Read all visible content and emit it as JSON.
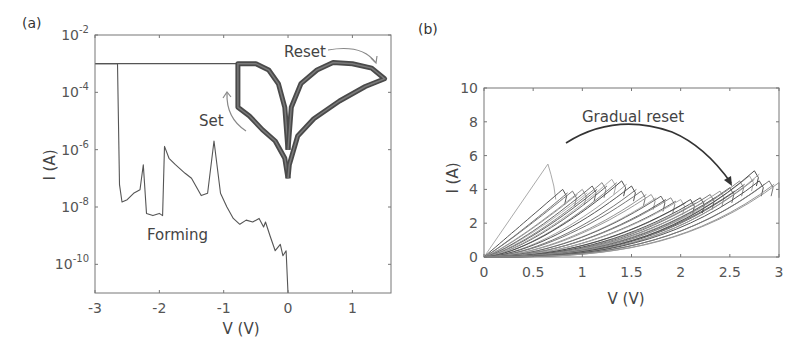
{
  "chart_data": [
    {
      "panel": "(a)",
      "type": "line",
      "xlabel": "V (V)",
      "ylabel": "I (A)",
      "yscale": "log",
      "xlim": [
        -3,
        1.6
      ],
      "ylim": [
        1e-11,
        0.01
      ],
      "xticks": [
        "-3",
        "-2",
        "-1",
        "0",
        "1"
      ],
      "yticks": [
        {
          "base": "10",
          "exp": "-2"
        },
        {
          "base": "10",
          "exp": "-4"
        },
        {
          "base": "10",
          "exp": "-6"
        },
        {
          "base": "10",
          "exp": "-8"
        },
        {
          "base": "10",
          "exp": "-10"
        }
      ],
      "grid": false,
      "annotations": [
        {
          "text": "Reset",
          "x": 0.85,
          "y": 0.0015
        },
        {
          "text": "Set",
          "x": -0.9,
          "y": 1.5e-05
        },
        {
          "text": "Forming",
          "x": -1.6,
          "y": 5e-09
        }
      ],
      "compliance_current": 0.001,
      "series": [
        {
          "name": "Forming",
          "points": [
            [
              0,
              1e-11
            ],
            [
              -0.03,
              3e-10
            ],
            [
              -0.08,
              2e-10
            ],
            [
              -0.12,
              5e-10
            ],
            [
              -0.2,
              3e-10
            ],
            [
              -0.28,
              1e-09
            ],
            [
              -0.35,
              3e-09
            ],
            [
              -0.38,
              2e-09
            ],
            [
              -0.45,
              4e-09
            ],
            [
              -0.55,
              3e-09
            ],
            [
              -0.65,
              3.5e-09
            ],
            [
              -0.75,
              2.5e-09
            ],
            [
              -0.85,
              4e-09
            ],
            [
              -0.95,
              1e-08
            ],
            [
              -1.05,
              3e-08
            ],
            [
              -1.15,
              2e-06
            ],
            [
              -1.25,
              3e-08
            ],
            [
              -1.35,
              2.5e-08
            ],
            [
              -1.5,
              1e-07
            ],
            [
              -1.6,
              1.5e-07
            ],
            [
              -1.75,
              3e-07
            ],
            [
              -1.85,
              5e-07
            ],
            [
              -1.92,
              1.3e-06
            ],
            [
              -1.95,
              5e-09
            ],
            [
              -2.0,
              6e-09
            ],
            [
              -2.1,
              5e-09
            ],
            [
              -2.2,
              6e-09
            ],
            [
              -2.25,
              3e-07
            ],
            [
              -2.3,
              4e-08
            ],
            [
              -2.4,
              3e-08
            ],
            [
              -2.5,
              1.8e-08
            ],
            [
              -2.58,
              1.5e-08
            ],
            [
              -2.62,
              6e-08
            ],
            [
              -2.65,
              0.001
            ],
            [
              -3,
              0.001
            ]
          ]
        },
        {
          "name": "Set",
          "points": [
            [
              0,
              1e-06
            ],
            [
              -0.05,
              3e-05
            ],
            [
              -0.15,
              0.0002
            ],
            [
              -0.3,
              0.0006
            ],
            [
              -0.5,
              0.001
            ],
            [
              -0.78,
              0.001
            ],
            [
              -0.78,
              3e-05
            ],
            [
              -0.6,
              1.5e-05
            ],
            [
              -0.4,
              5e-06
            ],
            [
              -0.2,
              2e-06
            ],
            [
              -0.05,
              5e-07
            ],
            [
              0,
              1e-07
            ]
          ]
        },
        {
          "name": "Reset",
          "points": [
            [
              0,
              1e-06
            ],
            [
              0.05,
              3e-05
            ],
            [
              0.2,
              0.0002
            ],
            [
              0.45,
              0.0006
            ],
            [
              0.7,
              0.0011
            ],
            [
              1.0,
              0.001
            ],
            [
              1.3,
              0.0007
            ],
            [
              1.5,
              0.0003
            ],
            [
              1.2,
              0.00016
            ],
            [
              0.8,
              5e-05
            ],
            [
              0.4,
              1.2e-05
            ],
            [
              0.15,
              3e-06
            ],
            [
              0.02,
              3e-07
            ],
            [
              0,
              1e-07
            ]
          ]
        }
      ]
    },
    {
      "panel": "(b)",
      "type": "line",
      "xlabel": "V (V)",
      "ylabel": "I (A)",
      "xlim": [
        0,
        3
      ],
      "ylim": [
        0,
        10
      ],
      "xticks": [
        "0",
        "0.5",
        "1",
        "1.5",
        "2",
        "2.5",
        "3"
      ],
      "yticks": [
        "0",
        "2",
        "4",
        "6",
        "8",
        "10"
      ],
      "grid": false,
      "annotations": [
        {
          "text": "Gradual reset",
          "x": 1.4,
          "y": 8.0
        }
      ],
      "series_description": "Many successive I-V sweeps; first sweep peaks at ~5.5 A near 0.65 V, subsequent sweeps reset gradually with peaks ~4-4.6 A shifting from ~0.8 V to ~3 V",
      "first_sweep": {
        "peak_v": 0.65,
        "peak_i": 5.5
      },
      "sweep_peaks": [
        [
          0.8,
          4.0
        ],
        [
          0.9,
          3.9
        ],
        [
          1.0,
          4.0
        ],
        [
          1.1,
          4.2
        ],
        [
          1.2,
          4.4
        ],
        [
          1.3,
          4.6
        ],
        [
          1.4,
          4.5
        ],
        [
          1.5,
          4.2
        ],
        [
          1.6,
          3.9
        ],
        [
          1.7,
          3.7
        ],
        [
          1.8,
          3.6
        ],
        [
          1.9,
          3.5
        ],
        [
          2.0,
          3.4
        ],
        [
          2.1,
          3.4
        ],
        [
          2.2,
          3.5
        ],
        [
          2.3,
          3.7
        ],
        [
          2.4,
          3.9
        ],
        [
          2.5,
          4.1
        ],
        [
          2.6,
          4.5
        ],
        [
          2.7,
          4.8
        ],
        [
          2.75,
          5.1
        ],
        [
          2.8,
          4.5
        ],
        [
          2.9,
          4.5
        ],
        [
          3.0,
          4.4
        ]
      ]
    }
  ]
}
